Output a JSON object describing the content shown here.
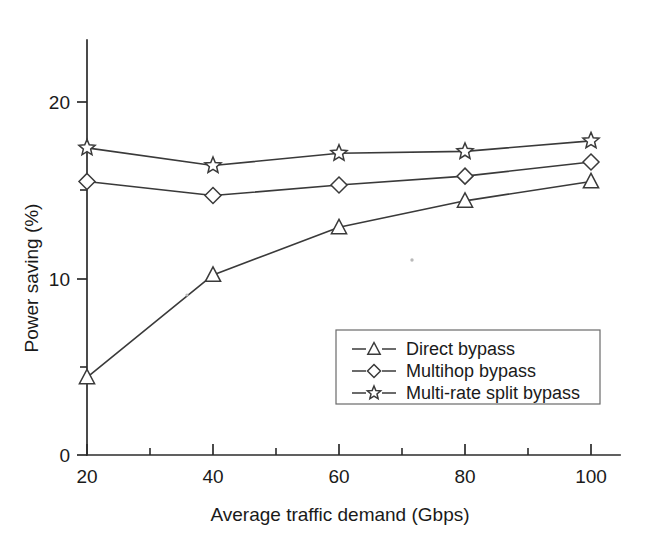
{
  "chart_data": {
    "type": "line",
    "title": "",
    "xlabel": "Average traffic demand (Gbps)",
    "ylabel": "Power saving (%)",
    "x": [
      20,
      40,
      60,
      80,
      100
    ],
    "xlim": [
      20,
      100
    ],
    "ylim": [
      0,
      23.5
    ],
    "xticks": [
      20,
      40,
      60,
      80,
      100
    ],
    "xtick_labels": [
      "20",
      "40",
      "60",
      "80",
      "100"
    ],
    "yticks": [
      0,
      10,
      20
    ],
    "ytick_labels": [
      "0",
      "10",
      "20"
    ],
    "yticks_minor": [
      5,
      15
    ],
    "grid": false,
    "legend_position": "lower right inside",
    "series": [
      {
        "name": "Direct bypass",
        "marker": "triangle",
        "values": [
          4.4,
          10.2,
          12.9,
          14.4,
          15.5
        ]
      },
      {
        "name": "Multihop bypass",
        "marker": "diamond",
        "values": [
          15.5,
          14.7,
          15.3,
          15.8,
          16.6
        ]
      },
      {
        "name": "Multi-rate split bypass",
        "marker": "star",
        "values": [
          17.4,
          16.4,
          17.1,
          17.2,
          17.8
        ]
      }
    ]
  },
  "axes": {
    "x_title": "Average traffic demand (Gbps)",
    "y_title": "Power saving (%)",
    "x_tick_labels": [
      "20",
      "40",
      "60",
      "80",
      "100"
    ],
    "y_tick_labels": [
      "0",
      "10",
      "20"
    ]
  },
  "legend": {
    "entries": [
      {
        "label": "Direct bypass",
        "marker": "triangle"
      },
      {
        "label": "Multihop bypass",
        "marker": "diamond"
      },
      {
        "label": "Multi-rate split bypass",
        "marker": "star"
      }
    ]
  },
  "colors": {
    "ink": "#1a1a1a",
    "line": "#3a3a3a",
    "axis": "#2b2b2b",
    "legend_border": "#6a6a6a",
    "background": "#ffffff"
  }
}
